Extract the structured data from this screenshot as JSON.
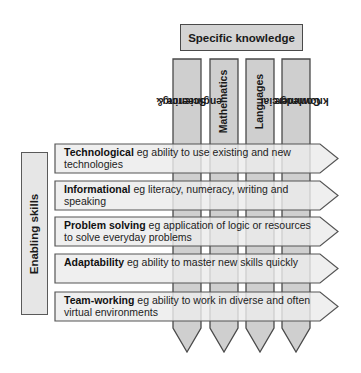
{
  "header": {
    "title": "Specific knowledge"
  },
  "columns": [
    {
      "label": "Science & engineering",
      "line1": "Science &",
      "line2": "engineering"
    },
    {
      "label": "Mathematics",
      "line1": "Mathematics",
      "line2": ""
    },
    {
      "label": "Languages",
      "line1": "Languages",
      "line2": ""
    },
    {
      "label": "Commercial knowledge",
      "line1": "Commercial",
      "line2": "knowledge"
    }
  ],
  "side": {
    "title": "Enabling skills"
  },
  "rows": [
    {
      "title": "Technological",
      "desc": " eg ability to use existing and new technologies"
    },
    {
      "title": "Informational",
      "desc": " eg literacy, numeracy, writing and speaking"
    },
    {
      "title": "Problem solving",
      "desc": " eg application of logic or resources to solve everyday problems"
    },
    {
      "title": "Adaptability",
      "desc": " eg ability to master new skills quickly"
    },
    {
      "title": "Team-working",
      "desc": " eg ability to work in diverse and often virtual environments"
    }
  ],
  "colors": {
    "column_fill": "#cfcfcf",
    "arrow_fill": "#ececec",
    "stroke": "#4a4a4a"
  }
}
